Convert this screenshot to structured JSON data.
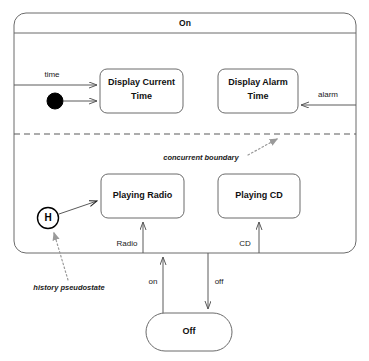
{
  "diagram": {
    "type": "uml-state-machine",
    "title": "On",
    "composite_state": {
      "name": "On",
      "label": "On"
    },
    "states": [
      {
        "id": "display-current-time",
        "label": "Display Current Time",
        "line1": "Display Current",
        "line2": "Time",
        "region": "top"
      },
      {
        "id": "display-alarm-time",
        "label": "Display Alarm Time",
        "line1": "Display Alarm",
        "line2": "Time",
        "region": "top"
      },
      {
        "id": "playing-radio",
        "label": "Playing Radio",
        "line1": "Playing Radio",
        "line2": "",
        "region": "bottom"
      },
      {
        "id": "playing-cd",
        "label": "Playing CD",
        "line1": "Playing CD",
        "line2": "",
        "region": "bottom"
      },
      {
        "id": "off",
        "label": "Off",
        "line1": "Off",
        "line2": "",
        "region": "outside"
      }
    ],
    "pseudostates": [
      {
        "id": "initial",
        "kind": "initial",
        "label": ""
      },
      {
        "id": "history",
        "kind": "shallow-history",
        "label": "H"
      }
    ],
    "transitions": [
      {
        "id": "t-time",
        "label": "time",
        "from": "boundary-left",
        "to": "display-current-time"
      },
      {
        "id": "t-initial",
        "label": "",
        "from": "initial",
        "to": "display-current-time"
      },
      {
        "id": "t-alarm",
        "label": "alarm",
        "from": "boundary-right",
        "to": "display-alarm-time"
      },
      {
        "id": "t-history",
        "label": "",
        "from": "history",
        "to": "playing-radio"
      },
      {
        "id": "t-radio",
        "label": "Radio",
        "from": "off",
        "to": "playing-radio"
      },
      {
        "id": "t-cd",
        "label": "CD",
        "from": "off",
        "to": "playing-cd"
      },
      {
        "id": "t-on",
        "label": "on",
        "from": "off",
        "to": "on"
      },
      {
        "id": "t-off",
        "label": "off",
        "from": "on",
        "to": "off"
      }
    ],
    "annotations": [
      {
        "id": "concurrent-boundary",
        "label": "concurrent boundary",
        "points_to": "dashed-separator"
      },
      {
        "id": "history-pseudostate",
        "label": "history pseudostate",
        "points_to": "history"
      }
    ],
    "colors": {
      "background": "#ffffff",
      "stroke": "#6b6b6b",
      "text": "#111111",
      "annotation": "#9a9a9a",
      "initial_node": "#000000"
    }
  }
}
